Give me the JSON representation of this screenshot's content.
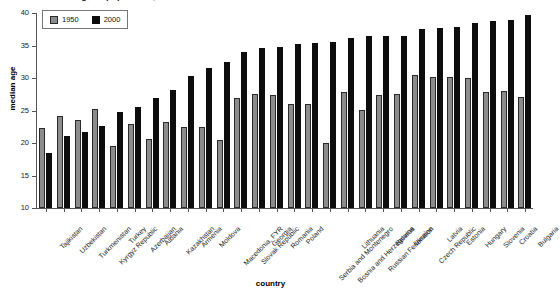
{
  "chart_data": {
    "type": "bar",
    "title": "Median age of population, 1950 and 2000",
    "xlabel": "country",
    "ylabel": "median age",
    "ylim": [
      10,
      40
    ],
    "yticks": [
      10,
      15,
      20,
      25,
      30,
      35,
      40
    ],
    "grid": false,
    "legend_position": "top-left",
    "categories": [
      "Tajikistan",
      "Uzbekistan",
      "Turkmenistan",
      "Kyrgyz Republic",
      "Turkey",
      "Azerbaijan",
      "Albania",
      "Kazakhstan",
      "Armenia",
      "Moldova",
      "Macedonia, FYR",
      "Slovak Republic",
      "Georgia",
      "Romania",
      "Poland",
      "Serbia and Montenegro",
      "Bosnia and Herzegovina",
      "Lithuania",
      "Russian Federation",
      "Belarus",
      "Ukraine",
      "Czech Republic",
      "Latvia",
      "Estonia",
      "Hungary",
      "Slovenia",
      "Croatia",
      "Bulgaria"
    ],
    "series": [
      {
        "name": "1950",
        "color": "#8c8c8c",
        "values": [
          22.3,
          24.1,
          23.6,
          25.2,
          19.6,
          22.9,
          20.6,
          23.2,
          22.5,
          22.4,
          20.5,
          26.9,
          27.5,
          27.4,
          26.0,
          26.0,
          20.0,
          27.9,
          25.1,
          27.4,
          27.6,
          30.5,
          30.1,
          30.1,
          30.0,
          27.9,
          28.0,
          27.1
        ]
      },
      {
        "name": "2000",
        "color": "#0d0d0d",
        "values": [
          18.4,
          21.1,
          21.7,
          22.6,
          24.8,
          25.6,
          27.0,
          28.1,
          30.3,
          31.6,
          32.5,
          34.0,
          34.6,
          34.8,
          35.3,
          35.4,
          35.6,
          36.1,
          36.4,
          36.4,
          36.5,
          37.6,
          37.7,
          37.8,
          38.4,
          38.7,
          39.0,
          39.7
        ]
      }
    ]
  },
  "legend": {
    "entries": [
      {
        "label": "1950"
      },
      {
        "label": "2000"
      }
    ]
  }
}
